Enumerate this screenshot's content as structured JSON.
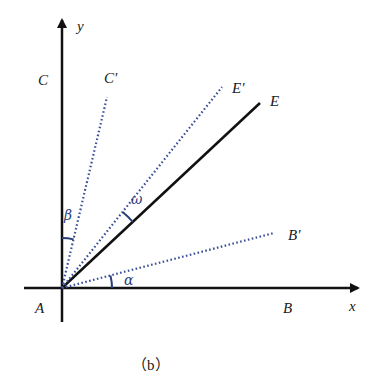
{
  "figure": {
    "caption": "（b）",
    "colors": {
      "axis": "#111111",
      "solid_line": "#111111",
      "dotted_line": "#3a4f9a",
      "arc": "#2a3f7a"
    },
    "axes": {
      "x_label": "x",
      "y_label": "y"
    },
    "points": {
      "origin": "A",
      "x_axis_point": "B",
      "y_axis_point": "C",
      "solid_ray": "E",
      "rotated_x": "B'",
      "rotated_y": "C'",
      "rotated_e": "E'"
    },
    "angles": {
      "between_AB_and_AB_prime": "α",
      "between_AC_and_AC_prime": "β",
      "between_AE_and_AE_prime": "ω"
    }
  }
}
